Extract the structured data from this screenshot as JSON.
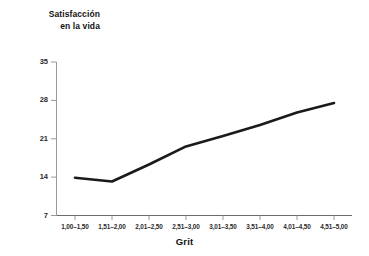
{
  "chart_data": {
    "type": "line",
    "title": "",
    "ylabel": "Satisfacción\nen la vida",
    "xlabel": "Grit",
    "categories": [
      "1,00–1,50",
      "1,51–2,00",
      "2,01–2,50",
      "2,51–3,00",
      "3,01–3,50",
      "3,51–4,00",
      "4,01–4,50",
      "4,51–5,00"
    ],
    "values": [
      13.9,
      13.2,
      16.3,
      19.6,
      21.5,
      23.5,
      25.8,
      27.5
    ],
    "yticks": [
      "7",
      "14",
      "21",
      "28",
      "35"
    ],
    "ylim": [
      7,
      35
    ],
    "grid": false,
    "legend": "none",
    "line_color": "#1a1a1a"
  },
  "axis": {
    "y_title_line1": "Satisfacción",
    "y_title_line2": "en la vida",
    "x_title": "Grit"
  }
}
